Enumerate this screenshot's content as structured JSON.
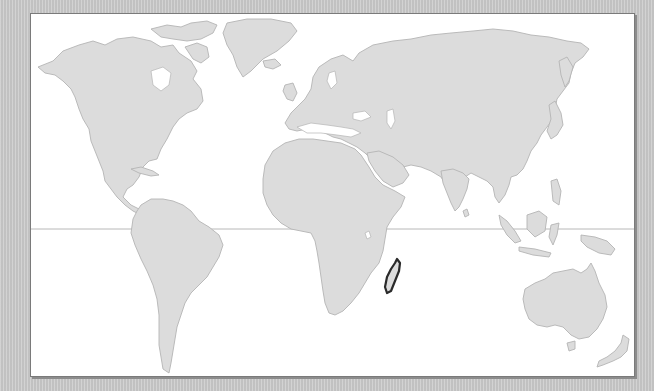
{
  "map": {
    "type": "world-locator-map",
    "projection": "miller-like",
    "highlighted_region": "Madagascar",
    "reference_lines": [
      "equator"
    ],
    "colors": {
      "background": "#c9c9c9",
      "frame": "#ffffff",
      "frame_border": "#7a7a7a",
      "land": "#dcdcdc",
      "coastline": "#b4b4b4",
      "highlight_outline": "#2a2a2a",
      "equator": "#b8b8b8"
    },
    "regions": [
      {
        "name": "North America"
      },
      {
        "name": "Greenland"
      },
      {
        "name": "South America"
      },
      {
        "name": "Europe"
      },
      {
        "name": "Asia"
      },
      {
        "name": "Africa"
      },
      {
        "name": "Madagascar",
        "highlighted": true
      },
      {
        "name": "Australia"
      },
      {
        "name": "New Zealand"
      },
      {
        "name": "Southeast Asia islands"
      }
    ]
  }
}
